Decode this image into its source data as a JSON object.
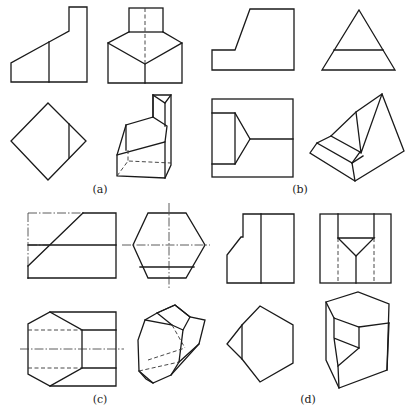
{
  "figure": {
    "type": "orthographic and isometric projection exercises",
    "panels": [
      {
        "id": "a",
        "caption": "(a)",
        "caption_pos": [
          100,
          192
        ],
        "views": [
          "front",
          "side",
          "top",
          "isometric"
        ]
      },
      {
        "id": "b",
        "caption": "(b)",
        "caption_pos": [
          300,
          192
        ],
        "views": [
          "front",
          "side",
          "top",
          "isometric"
        ]
      },
      {
        "id": "c",
        "caption": "(c)",
        "caption_pos": [
          100,
          400
        ],
        "views": [
          "front",
          "side",
          "top",
          "isometric"
        ]
      },
      {
        "id": "d",
        "caption": "(d)",
        "caption_pos": [
          308,
          400
        ],
        "views": [
          "front",
          "side",
          "top",
          "isometric"
        ]
      }
    ],
    "line_color": "#1a1a1a",
    "background": "#ffffff"
  }
}
